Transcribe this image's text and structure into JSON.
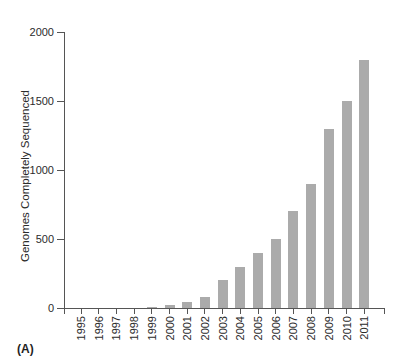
{
  "panel_label": "(A)",
  "chart_data": {
    "type": "bar",
    "title": "",
    "xlabel": "",
    "ylabel": "Genomes Completely Sequenced",
    "categories": [
      "1995",
      "1996",
      "1997",
      "1998",
      "1999",
      "2000",
      "2001",
      "2002",
      "2003",
      "2004",
      "2005",
      "2006",
      "2007",
      "2008",
      "2009",
      "2010",
      "2011"
    ],
    "values": [
      0,
      0,
      0,
      0,
      10,
      25,
      45,
      80,
      200,
      300,
      400,
      500,
      700,
      900,
      1300,
      1500,
      1800
    ],
    "ylim": [
      0,
      2000
    ],
    "yticks": [
      0,
      500,
      1000,
      1500,
      2000
    ],
    "grid": false,
    "legend": "none",
    "bar_color": "#ababab",
    "axis_color": "#555555",
    "text_color": "#2b2b2b"
  }
}
